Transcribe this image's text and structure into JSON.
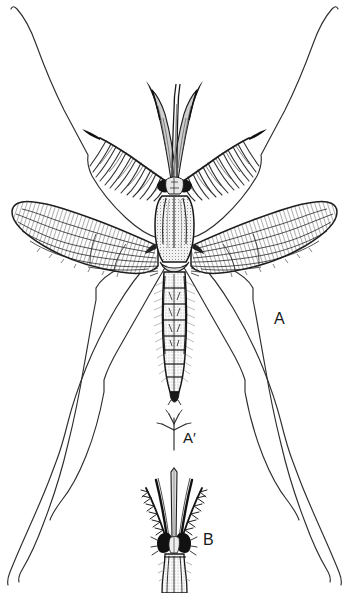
{
  "plate": {
    "kind": "scientific-illustration",
    "subject": "mosquito-plate",
    "background_color": "#ffffff",
    "ink_color": "#1a1a1a",
    "width": 349,
    "height": 593
  },
  "labels": {
    "a": "A",
    "a_prime": "A′",
    "b": "B"
  },
  "parts": {
    "antenna_left": "plumose-antenna-left",
    "antenna_right": "plumose-antenna-right",
    "palp_left": "maxillary-palp-left",
    "palp_right": "maxillary-palp-right",
    "proboscis": "proboscis",
    "eye_left": "compound-eye-left",
    "eye_right": "compound-eye-right",
    "thorax": "thorax",
    "abdomen": "abdomen",
    "wing_left": "wing-left",
    "wing_right": "wing-right",
    "legs": "legs",
    "detail_a_prime": "wing-scale-detail",
    "female_head": "female-head-figure-b"
  }
}
